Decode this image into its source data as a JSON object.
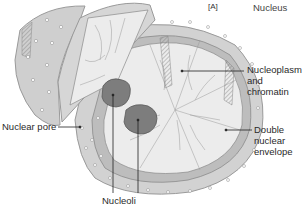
{
  "figure": {
    "panel_tag": "[A]",
    "title": "Nucleus"
  },
  "labels": {
    "nucleoplasm": [
      "Nucleoplasm",
      "and",
      "chromatin"
    ],
    "double_envelope": [
      "Double",
      "nuclear",
      "envelope"
    ],
    "nuclear_pore": "Nuclear pore",
    "nucleoli": "Nucleoli"
  },
  "colors": {
    "envelope_fill": "#d2d2d2",
    "envelope_edge": "#9a9a9a",
    "interior_fill": "#ececec",
    "nucleolus_fill": "#7d7d7d",
    "leader_line": "#222222",
    "pore": "#ffffff"
  }
}
